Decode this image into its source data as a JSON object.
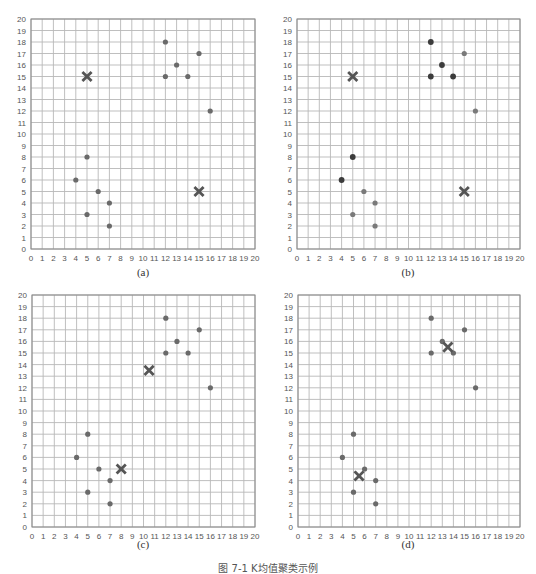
{
  "figure": {
    "caption": "图 7-1  K均值聚类示例",
    "panel_labels": [
      "(a)",
      "(b)",
      "(c)",
      "(d)"
    ]
  },
  "colors": {
    "grid": "#b8b8b8",
    "axis": "#888888",
    "point": "#6a6a6a",
    "point_dark": "#3c3c3c",
    "point_light": "#7a7a7a",
    "centroid": "#555555",
    "tick_text": "#555555"
  },
  "chart_data": [
    {
      "type": "scatter",
      "label": "(a)",
      "xlim": [
        0,
        20
      ],
      "ylim": [
        0,
        20
      ],
      "xticks": [
        0,
        1,
        2,
        3,
        4,
        5,
        6,
        7,
        8,
        9,
        10,
        11,
        12,
        13,
        14,
        15,
        16,
        17,
        18,
        19,
        20
      ],
      "yticks": [
        0,
        1,
        2,
        3,
        4,
        5,
        6,
        7,
        8,
        9,
        10,
        11,
        12,
        13,
        14,
        15,
        16,
        17,
        18,
        19,
        20
      ],
      "grid": true,
      "series": [
        {
          "name": "points",
          "marker": "circle",
          "points": [
            [
              12,
              18
            ],
            [
              15,
              17
            ],
            [
              13,
              16
            ],
            [
              12,
              15
            ],
            [
              14,
              15
            ],
            [
              16,
              12
            ],
            [
              5,
              8
            ],
            [
              4,
              6
            ],
            [
              6,
              5
            ],
            [
              7,
              4
            ],
            [
              5,
              3
            ],
            [
              7,
              2
            ]
          ]
        },
        {
          "name": "centroids",
          "marker": "x",
          "points": [
            [
              5,
              15
            ],
            [
              15,
              5
            ]
          ]
        }
      ]
    },
    {
      "type": "scatter",
      "label": "(b)",
      "xlim": [
        0,
        20
      ],
      "ylim": [
        0,
        20
      ],
      "xticks": [
        0,
        1,
        2,
        3,
        4,
        5,
        6,
        7,
        8,
        9,
        10,
        11,
        12,
        13,
        14,
        15,
        16,
        17,
        18,
        19,
        20
      ],
      "yticks": [
        0,
        1,
        2,
        3,
        4,
        5,
        6,
        7,
        8,
        9,
        10,
        11,
        12,
        13,
        14,
        15,
        16,
        17,
        18,
        19,
        20
      ],
      "grid": true,
      "series": [
        {
          "name": "cluster-1 points",
          "marker": "circle",
          "shade": "dark",
          "points": [
            [
              12,
              18
            ],
            [
              13,
              16
            ],
            [
              12,
              15
            ],
            [
              14,
              15
            ],
            [
              5,
              8
            ],
            [
              4,
              6
            ]
          ]
        },
        {
          "name": "cluster-2 points",
          "marker": "circle",
          "shade": "light",
          "points": [
            [
              15,
              17
            ],
            [
              16,
              12
            ],
            [
              6,
              5
            ],
            [
              7,
              4
            ],
            [
              5,
              3
            ],
            [
              7,
              2
            ]
          ]
        },
        {
          "name": "centroids",
          "marker": "x",
          "points": [
            [
              5,
              15
            ],
            [
              15,
              5
            ]
          ]
        }
      ]
    },
    {
      "type": "scatter",
      "label": "(c)",
      "xlim": [
        0,
        20
      ],
      "ylim": [
        0,
        20
      ],
      "xticks": [
        0,
        1,
        2,
        3,
        4,
        5,
        6,
        7,
        8,
        9,
        10,
        11,
        12,
        13,
        14,
        15,
        16,
        17,
        18,
        19,
        20
      ],
      "yticks": [
        0,
        1,
        2,
        3,
        4,
        5,
        6,
        7,
        8,
        9,
        10,
        11,
        12,
        13,
        14,
        15,
        16,
        17,
        18,
        19,
        20
      ],
      "grid": true,
      "series": [
        {
          "name": "points",
          "marker": "circle",
          "points": [
            [
              12,
              18
            ],
            [
              15,
              17
            ],
            [
              13,
              16
            ],
            [
              12,
              15
            ],
            [
              14,
              15
            ],
            [
              16,
              12
            ],
            [
              5,
              8
            ],
            [
              4,
              6
            ],
            [
              6,
              5
            ],
            [
              7,
              4
            ],
            [
              5,
              3
            ],
            [
              7,
              2
            ]
          ]
        },
        {
          "name": "centroids",
          "marker": "x",
          "points": [
            [
              10.5,
              13.5
            ],
            [
              8,
              5
            ]
          ]
        }
      ]
    },
    {
      "type": "scatter",
      "label": "(d)",
      "xlim": [
        0,
        20
      ],
      "ylim": [
        0,
        20
      ],
      "xticks": [
        0,
        1,
        2,
        3,
        4,
        5,
        6,
        7,
        8,
        9,
        10,
        11,
        12,
        13,
        14,
        15,
        16,
        17,
        18,
        19,
        20
      ],
      "yticks": [
        0,
        1,
        2,
        3,
        4,
        5,
        6,
        7,
        8,
        9,
        10,
        11,
        12,
        13,
        14,
        15,
        16,
        17,
        18,
        19,
        20
      ],
      "grid": true,
      "series": [
        {
          "name": "points",
          "marker": "circle",
          "points": [
            [
              12,
              18
            ],
            [
              15,
              17
            ],
            [
              13,
              16
            ],
            [
              12,
              15
            ],
            [
              14,
              15
            ],
            [
              16,
              12
            ],
            [
              5,
              8
            ],
            [
              4,
              6
            ],
            [
              6,
              5
            ],
            [
              7,
              4
            ],
            [
              5,
              3
            ],
            [
              7,
              2
            ]
          ]
        },
        {
          "name": "centroids",
          "marker": "x",
          "points": [
            [
              13.5,
              15.5
            ],
            [
              5.5,
              4.4
            ]
          ]
        }
      ]
    }
  ]
}
